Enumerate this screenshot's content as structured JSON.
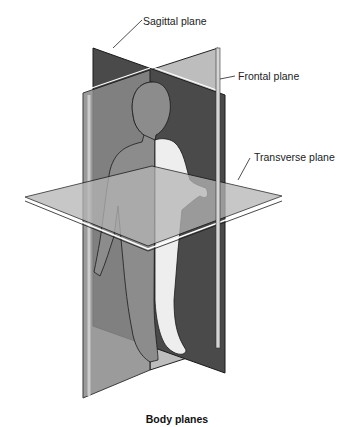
{
  "diagram": {
    "caption": "Body planes",
    "labels": {
      "sagittal": "Sagittal plane",
      "frontal": "Frontal plane",
      "transverse": "Transverse plane"
    },
    "colors": {
      "sagittal_plane": "#4a4a4a",
      "frontal_plane": "#bdbdbd",
      "front_panel": "#8a8a8a",
      "transverse_plane": "#b5b5b5",
      "body_shaded": "#8c8c8c",
      "body_light": "#eeeeee",
      "outline": "#1a1a1a"
    }
  }
}
